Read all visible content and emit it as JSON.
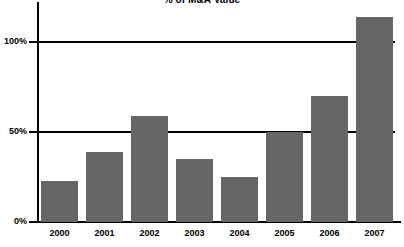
{
  "chart_data": {
    "type": "bar",
    "title": "% of M&A Value",
    "xlabel": "",
    "ylabel": "",
    "categories": [
      "2000",
      "2001",
      "2002",
      "2003",
      "2004",
      "2005",
      "2006",
      "2007"
    ],
    "values": [
      23,
      39,
      59,
      35,
      25,
      50,
      70,
      114
    ],
    "value_unit": "%",
    "ylim": [
      0,
      125
    ],
    "ytick_values": [
      0,
      50,
      100
    ],
    "ytick_labels": [
      "0%",
      "50%",
      "100%"
    ],
    "grid": "horizontal-at-50-and-100",
    "legend": "none",
    "series": [
      {
        "name": "% of M&A Value",
        "color": "#666666",
        "values": [
          23,
          39,
          59,
          35,
          25,
          50,
          70,
          114
        ]
      }
    ],
    "colors": {
      "bar": "#666666",
      "axis": "#000000",
      "grid": "#000000",
      "background": "#ffffff",
      "text": "#000000"
    }
  }
}
